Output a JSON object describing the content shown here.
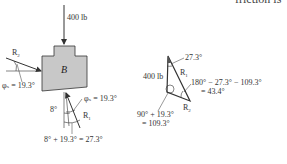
{
  "header_text": "friction is",
  "free_body_diagram": {
    "block_label": "B",
    "block_fill": "#c8c8c8",
    "applied_force": "400 lb",
    "reaction_left": "R",
    "reaction_left_sub": "2",
    "reaction_bottom": "R",
    "reaction_bottom_sub": "1",
    "angle_left": "φₛ = 19.3°",
    "angle_bottom": "φₛ = 19.3°",
    "angle_incline": "8°",
    "angle_sum": "8° + 19.3° = 27.3°"
  },
  "force_triangle": {
    "side_vertical": "400 lb",
    "side_r1": "R",
    "side_r1_sub": "1",
    "side_r2": "R",
    "side_r2_sub": "2",
    "angle_top": "27.3°",
    "angle_right_line1": "180° − 27.3° − 109.3°",
    "angle_right_line2": "= 43.4°",
    "angle_left_line1": "90° + 19.3°",
    "angle_left_line2": "= 109.3°"
  }
}
